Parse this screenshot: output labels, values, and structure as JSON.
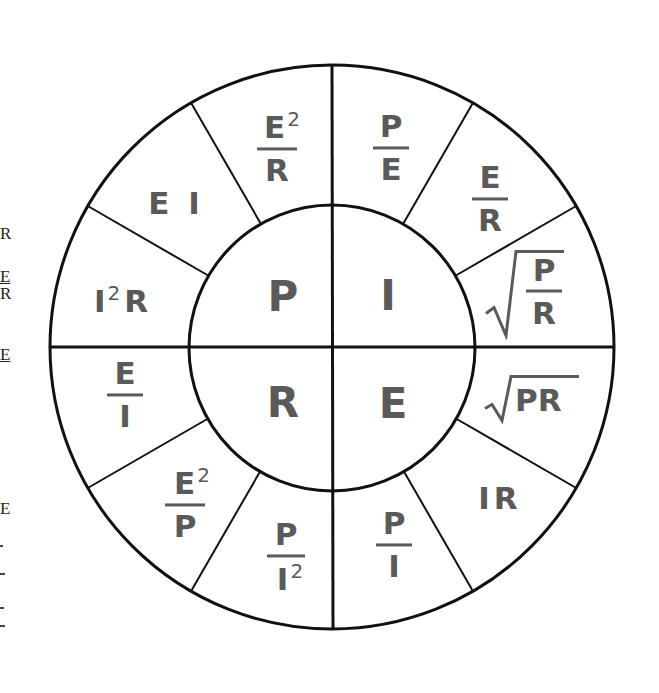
{
  "diagram": {
    "colors": {
      "line": "#111111",
      "text": "#5a5a5a",
      "background": "#ffffff"
    },
    "center": {
      "x": 332,
      "y": 347
    },
    "outer_radius": 282,
    "inner_radius": 143,
    "inner_quadrants": [
      {
        "id": "P",
        "label": "P",
        "quadrant": "top-left"
      },
      {
        "id": "I",
        "label": "I",
        "quadrant": "top-right"
      },
      {
        "id": "R",
        "label": "R",
        "quadrant": "bottom-left"
      },
      {
        "id": "E",
        "label": "E",
        "quadrant": "bottom-right"
      }
    ],
    "outer_sectors": {
      "P": [
        {
          "formula": "E2/R",
          "num": "E",
          "num_exp": "2",
          "den": "R"
        },
        {
          "formula": "EI",
          "text": "E I"
        },
        {
          "formula": "I2R",
          "base": "I",
          "exp": "2",
          "tail": "R"
        }
      ],
      "I": [
        {
          "formula": "P/E",
          "num": "P",
          "den": "E"
        },
        {
          "formula": "E/R",
          "num": "E",
          "den": "R"
        },
        {
          "formula": "sqrt(P/R)",
          "num": "P",
          "den": "R"
        }
      ],
      "E": [
        {
          "formula": "sqrt(PR)",
          "text": "PR"
        },
        {
          "formula": "IR",
          "text": "IR"
        },
        {
          "formula": "P/I",
          "num": "P",
          "den": "I"
        }
      ],
      "R": [
        {
          "formula": "E/I",
          "num": "E",
          "den": "I"
        },
        {
          "formula": "E2/P",
          "num": "E",
          "num_exp": "2",
          "den": "P"
        },
        {
          "formula": "P/I2",
          "num": "P",
          "den": "I",
          "den_exp": "2"
        }
      ]
    },
    "left_margin_fragments": [
      "R",
      "E",
      "R",
      "E",
      "E"
    ]
  }
}
